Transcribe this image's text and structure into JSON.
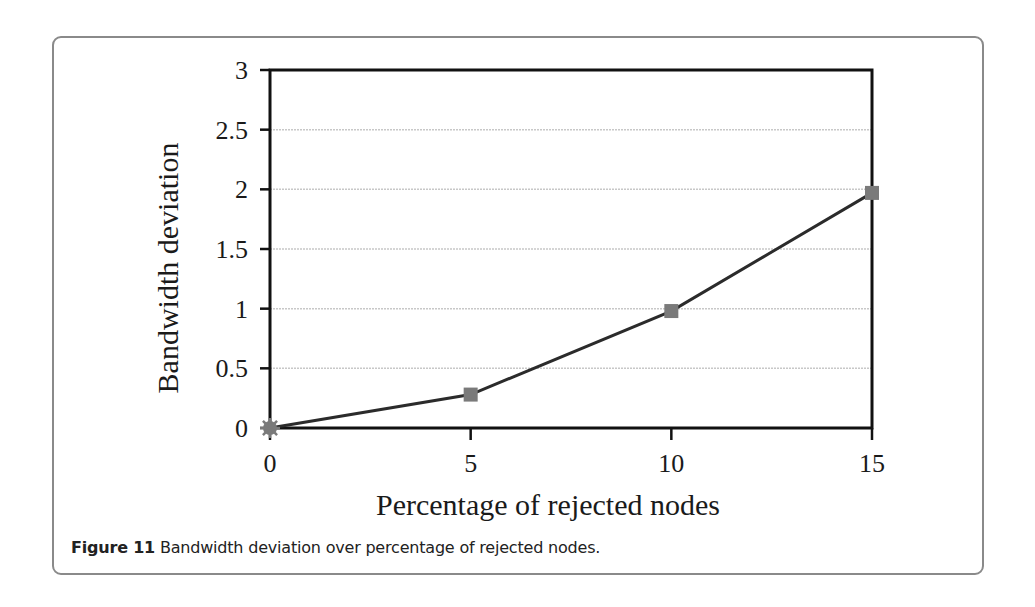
{
  "figure": {
    "caption_label": "Figure 11",
    "caption_text": " Bandwidth deviation over percentage of rejected nodes."
  },
  "colors": {
    "line": "#2b2b2b",
    "marker": "#7a7a7a",
    "gridline": "#c8c8c8",
    "axis": "#111111",
    "frame": "#8a8a8a"
  },
  "chart_data": {
    "type": "line",
    "title": "",
    "xlabel": "Percentage of rejected nodes",
    "ylabel": "Bandwidth deviation",
    "x": [
      0,
      5,
      10,
      15
    ],
    "series": [
      {
        "name": "Bandwidth deviation",
        "values": [
          0,
          0.28,
          0.98,
          1.97
        ],
        "markers": [
          "star",
          "square",
          "square",
          "square"
        ]
      }
    ],
    "xlim": [
      0,
      15
    ],
    "ylim": [
      0,
      3
    ],
    "xticks": [
      "0",
      "5",
      "10",
      "15"
    ],
    "yticks": [
      "0",
      "0.5",
      "1",
      "1.5",
      "2",
      "2.5",
      "3"
    ],
    "grid": {
      "horizontal": true,
      "vertical": false
    },
    "legend": null
  }
}
